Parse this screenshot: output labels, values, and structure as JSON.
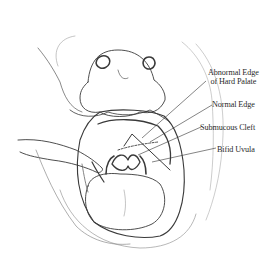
{
  "figure": {
    "labels": [
      {
        "id": "abnormal-edge",
        "line1": "Abnormal Edge",
        "line2": "of Hard Palate"
      },
      {
        "id": "normal-edge",
        "line1": "Normal Edge"
      },
      {
        "id": "submucous-cleft",
        "line1": "Submucous Cleft"
      },
      {
        "id": "bifid-uvula",
        "line1": "Bifid Uvula"
      }
    ],
    "colors": {
      "ink": "#2a2a2a",
      "background": "#ffffff"
    }
  }
}
